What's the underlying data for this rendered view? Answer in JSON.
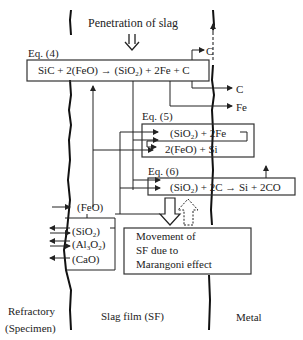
{
  "header": {
    "penetration_label": "Penetration of slag"
  },
  "equations": {
    "eq4": {
      "label": "Eq. (4)",
      "lhs": "SiC + 2(FeO)",
      "rhs_a": "(SiO",
      "rhs_sub": "2",
      "rhs_b": ") + 2Fe + C"
    },
    "eq5": {
      "label": "Eq. (5)",
      "line1_a": "(SiO",
      "line1_sub": "2",
      "line1_b": ") + 2Fe",
      "line2": "2(FeO) + Si"
    },
    "eq6": {
      "label": "Eq. (6)",
      "lhs_a": "(SiO",
      "lhs_sub": "2",
      "lhs_b": ") + 2C",
      "rhs": "Si + 2CO"
    }
  },
  "products": {
    "c_top": "C",
    "c_mid": "C",
    "fe": "Fe"
  },
  "oxides": {
    "feo": "(FeO)",
    "sio2_a": "(SiO",
    "sio2_sub": "2",
    "sio2_b": ")",
    "al_a": "(Al",
    "al_sub1": "3",
    "al_mid": "O",
    "al_sub2": "2",
    "al_b": ")",
    "cao": "(CaO)"
  },
  "marangoni": {
    "line1": "Movement of",
    "line2": "SF due to",
    "line3": "Marangoni effect"
  },
  "regions": {
    "refractory_line1": "Refractory",
    "refractory_line2": "(Specimen)",
    "slag_film": "Slag film (SF)",
    "metal": "Metal"
  }
}
